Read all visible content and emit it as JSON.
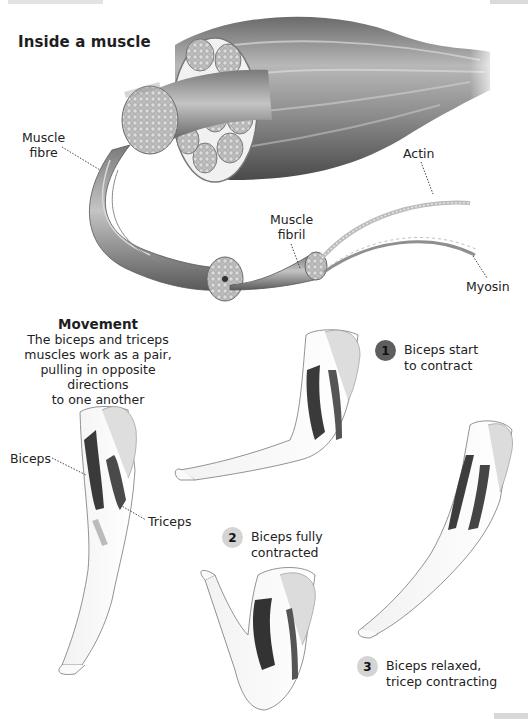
{
  "diagram": {
    "type": "educational-illustration"
  },
  "top_section": {
    "title": "Inside a muscle",
    "labels": {
      "muscle_fibre": [
        "Muscle",
        "fibre"
      ],
      "muscle_fibril": [
        "Muscle",
        "fibril"
      ],
      "actin": "Actin",
      "myosin": "Myosin"
    }
  },
  "movement_section": {
    "title": "Movement",
    "description": [
      "The biceps and triceps",
      "muscles work as a pair,",
      "pulling in opposite directions",
      "to one another"
    ],
    "arm_labels": {
      "biceps": "Biceps",
      "triceps": "Triceps"
    },
    "steps": [
      {
        "number": "1",
        "lines": [
          "Biceps start",
          "to contract"
        ],
        "badge_color": "#5e5e5e"
      },
      {
        "number": "2",
        "lines": [
          "Biceps fully",
          "contracted"
        ],
        "badge_color": "#d4d4d4"
      },
      {
        "number": "3",
        "lines": [
          "Biceps relaxed,",
          "tricep contracting"
        ],
        "badge_color": "#c8c8c8"
      }
    ]
  },
  "colors": {
    "background": "#ffffff",
    "text": "#1e1e1e",
    "muscle_dark": "#3a3a3a",
    "muscle_mid": "#8a8a8a",
    "muscle_light": "#c9c9c9",
    "bone": "#e4e4e4"
  }
}
